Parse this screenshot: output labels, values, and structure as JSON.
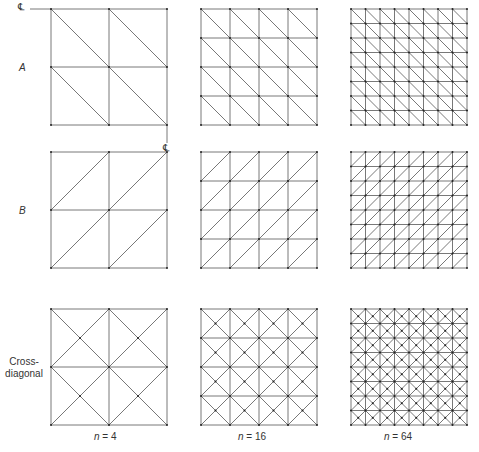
{
  "figure": {
    "rows": [
      {
        "id": "A",
        "label": "A",
        "pattern": "diag-down"
      },
      {
        "id": "B",
        "label": "B",
        "pattern": "diag-up"
      },
      {
        "id": "C",
        "label": "Cross-\ndiagonal",
        "label_line1": "Cross-",
        "label_line2": "diagonal",
        "pattern": "cross"
      }
    ],
    "columns": [
      {
        "n_label": "n",
        "eq": " = 4",
        "divisions": 2
      },
      {
        "n_label": "n",
        "eq": " = 16",
        "divisions": 4
      },
      {
        "n_label": "n",
        "eq": " = 64",
        "divisions": 8
      }
    ],
    "centerline_symbol": "℄",
    "centerline_marks": [
      {
        "x": 18,
        "y": 2
      },
      {
        "x": 163,
        "y": 143
      }
    ],
    "line_color": "#555555",
    "node_color": "#222222"
  }
}
